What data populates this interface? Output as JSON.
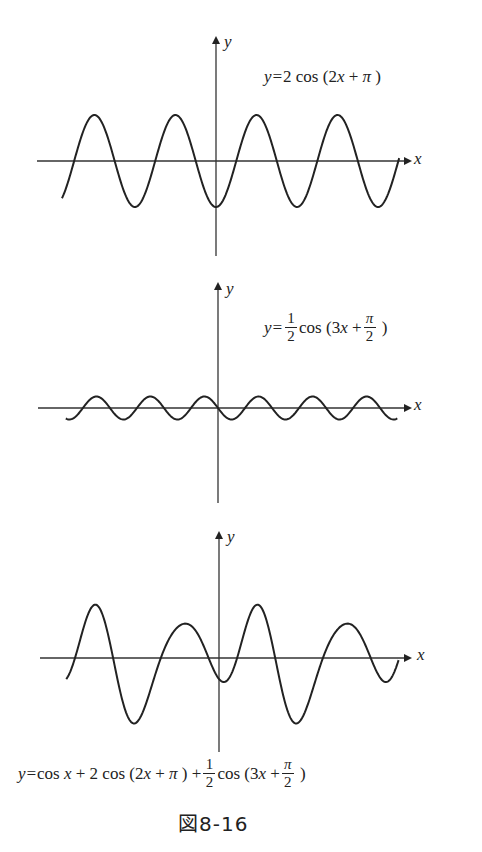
{
  "figure_label": "図8-16",
  "axis_labels": {
    "x": "x",
    "y": "y"
  },
  "graphs": [
    {
      "name": "graph-1",
      "equation": {
        "lhs": "y=",
        "text": "2 cos (2x + π )",
        "coef": "2",
        "fn": "cos",
        "arg_open": "(",
        "arg_a": "2",
        "arg_var": "x",
        "plus": "+",
        "phase": "π",
        "arg_close": ")"
      }
    },
    {
      "name": "graph-2",
      "equation": {
        "lhs": "y=",
        "text": "1/2 cos (3x + π/2 )",
        "coef_num": "1",
        "coef_den": "2",
        "fn": "cos",
        "arg_open": "(",
        "arg_a": "3",
        "arg_var": "x",
        "plus": "+",
        "phase_num": "π",
        "phase_den": "2",
        "arg_close": ")"
      }
    },
    {
      "name": "graph-3",
      "equation": {
        "lhs": "y=",
        "t1": "cos",
        "t1var": "x",
        "plus1": "+",
        "t2": "2 cos",
        "t2arg": "(2",
        "t2var": "x",
        "t2plus": "+",
        "t2phase": "π",
        "t2close": ")",
        "plus2": "+",
        "coef_num": "1",
        "coef_den": "2",
        "t3": "cos",
        "t3arg": "(3",
        "t3var": "x",
        "t3plus": "+",
        "phase_num": "π",
        "phase_den": "2",
        "t3close": ")"
      }
    }
  ],
  "chart_data": [
    {
      "type": "line",
      "title": "y=2cos(2x+π)",
      "xlabel": "x",
      "ylabel": "y",
      "function": "2*cos(2*x+PI)",
      "x_range": [
        -5.97,
        7.1
      ],
      "ylim": [
        -2,
        2
      ],
      "grid": false,
      "origin_px": [
        216,
        161
      ],
      "scale_px": [
        25.8,
        23
      ],
      "axis_px": {
        "x_from": 37,
        "x_to": 410,
        "y_from": 38,
        "y_to": 256
      }
    },
    {
      "type": "line",
      "title": "y=1/2 cos(3x+π/2)",
      "xlabel": "x",
      "ylabel": "y",
      "function": "0.5*cos(3*x+PI/2)",
      "x_range": [
        -5.9,
        6.95
      ],
      "ylim": [
        -0.5,
        0.5
      ],
      "grid": false,
      "origin_px": [
        218,
        408
      ],
      "scale_px": [
        25.8,
        23
      ],
      "axis_px": {
        "x_from": 38,
        "x_to": 410,
        "y_from": 284,
        "y_to": 503
      }
    },
    {
      "type": "line",
      "title": "y=cos x + 2cos(2x+π) + 1/2 cos(3x+π/2)",
      "xlabel": "x",
      "ylabel": "y",
      "function": "cos(x)+2*cos(2*x+PI)+0.5*cos(3*x+PI/2)",
      "x_range": [
        -5.92,
        6.96
      ],
      "ylim": [
        -3,
        3
      ],
      "grid": false,
      "origin_px": [
        219,
        658
      ],
      "scale_px": [
        25.8,
        21
      ],
      "axis_px": {
        "x_from": 40,
        "x_to": 410,
        "y_from": 533,
        "y_to": 752
      }
    }
  ]
}
